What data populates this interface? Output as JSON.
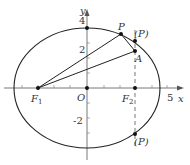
{
  "figure": {
    "type": "ellipse-focal-diagram",
    "axes": {
      "x_label": "x",
      "y_label": "y",
      "origin_label": "O",
      "x_tick_label": "5",
      "y_tick_labels": {
        "top": "4",
        "mid": "2",
        "neg": "-2"
      }
    },
    "points": {
      "F1": {
        "label": "F",
        "sub": "1"
      },
      "F2": {
        "label": "F",
        "sub": "2"
      },
      "P": {
        "label": "P"
      },
      "A": {
        "label": "A"
      },
      "P_upper_alt": {
        "label": "(P)"
      },
      "P_lower_alt": {
        "label": "(P)"
      }
    },
    "colors": {
      "stroke": "#222222",
      "axis": "#555555",
      "text": "#333333"
    }
  }
}
